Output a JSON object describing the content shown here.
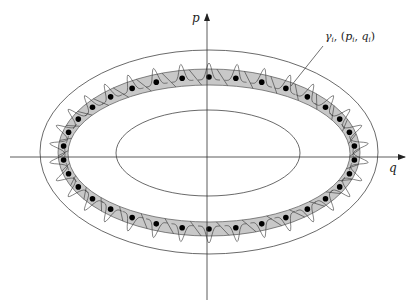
{
  "figure": {
    "type": "phase-space-diagram",
    "axes": {
      "horizontal_label": "q",
      "vertical_label": "p"
    },
    "annotation": {
      "label": "γ",
      "subscript": "i",
      "separator": ", (",
      "p_sym": "p",
      "p_sub": "i",
      "comma": ", ",
      "q_sym": "q",
      "q_sub": "i",
      "close": ")"
    },
    "regions": [
      {
        "name": "outer-ellipse",
        "cx": 209,
        "cy": 152,
        "rx": 169,
        "ry": 102
      },
      {
        "name": "band-outer",
        "cx": 209,
        "cy": 152.5,
        "rx": 151,
        "ry": 83.5
      },
      {
        "name": "band-inner",
        "cx": 209,
        "cy": 153.5,
        "rx": 141,
        "ry": 68.5
      },
      {
        "name": "inner-ellipse",
        "cx": 208,
        "cy": 153,
        "rx": 92,
        "ry": 43
      }
    ],
    "ring": {
      "cx": 209,
      "cy": 153,
      "rx": 146,
      "ry": 76,
      "count": 34,
      "band_fill": "#c8c8c8",
      "dot_color": "#000000",
      "line_color": "#333333"
    }
  }
}
